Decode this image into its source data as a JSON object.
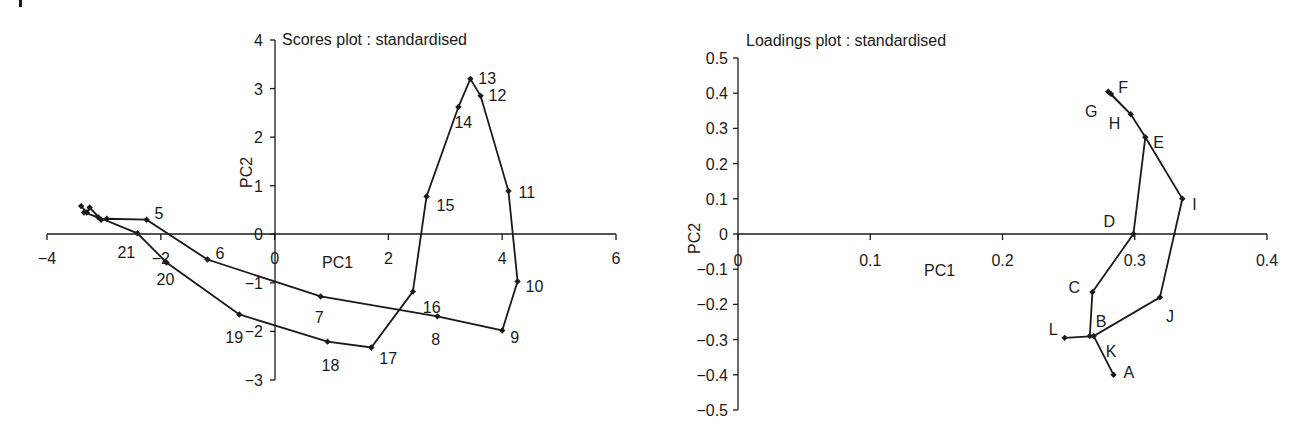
{
  "chart_data": [
    {
      "id": "scores",
      "type": "line",
      "title": "Scores plot : standardised",
      "xlabel": "PC1",
      "ylabel": "PC2",
      "xlim": [
        -4,
        6
      ],
      "ylim": [
        -3,
        4
      ],
      "xticks": [
        -4,
        -2,
        0,
        2,
        4,
        6
      ],
      "xtick_labels": [
        "−4",
        "−2",
        "0",
        "2",
        "4",
        "6"
      ],
      "yticks": [
        -3,
        -2,
        -1,
        0,
        1,
        2,
        3,
        4
      ],
      "ytick_labels": [
        "−3",
        "−2",
        "−1",
        "0",
        "1",
        "2",
        "3",
        "4"
      ],
      "grid": false,
      "legend": null,
      "marker": "diamond",
      "connected": true,
      "points": [
        {
          "label": "1",
          "x": -3.4,
          "y": 0.58,
          "show_label": false
        },
        {
          "label": "2",
          "x": -3.3,
          "y": 0.45,
          "show_label": false
        },
        {
          "label": "3",
          "x": -3.25,
          "y": 0.55,
          "show_label": false
        },
        {
          "label": "4",
          "x": -3.05,
          "y": 0.3,
          "show_label": false
        },
        {
          "label": "",
          "x": -2.95,
          "y": 0.32,
          "show_label": false
        },
        {
          "label": "5",
          "x": -2.25,
          "y": 0.3,
          "show_label": true
        },
        {
          "label": "6",
          "x": -1.18,
          "y": -0.52,
          "show_label": true
        },
        {
          "label": "7",
          "x": 0.81,
          "y": -1.28,
          "show_label": true
        },
        {
          "label": "8",
          "x": 2.86,
          "y": -1.69,
          "show_label": true
        },
        {
          "label": "9",
          "x": 4.0,
          "y": -1.98,
          "show_label": true
        },
        {
          "label": "10",
          "x": 4.27,
          "y": -0.97,
          "show_label": true
        },
        {
          "label": "11",
          "x": 4.11,
          "y": 0.89,
          "show_label": true
        },
        {
          "label": "12",
          "x": 3.62,
          "y": 2.85,
          "show_label": true
        },
        {
          "label": "13",
          "x": 3.44,
          "y": 3.2,
          "show_label": true
        },
        {
          "label": "14",
          "x": 3.23,
          "y": 2.62,
          "show_label": true
        },
        {
          "label": "15",
          "x": 2.67,
          "y": 0.78,
          "show_label": true
        },
        {
          "label": "16",
          "x": 2.43,
          "y": -1.18,
          "show_label": true
        },
        {
          "label": "17",
          "x": 1.7,
          "y": -2.33,
          "show_label": true
        },
        {
          "label": "18",
          "x": 0.93,
          "y": -2.21,
          "show_label": true
        },
        {
          "label": "19",
          "x": -0.62,
          "y": -1.65,
          "show_label": true
        },
        {
          "label": "20",
          "x": -1.9,
          "y": -0.58,
          "show_label": true
        },
        {
          "label": "21",
          "x": -2.41,
          "y": 0.02,
          "show_label": true
        },
        {
          "label": "",
          "x": -3.1,
          "y": 0.35,
          "show_label": false
        },
        {
          "label": "",
          "x": -3.35,
          "y": 0.45,
          "show_label": false
        }
      ],
      "label_offsets": {
        "5": [
          8,
          -6
        ],
        "6": [
          8,
          -6
        ],
        "7": [
          -6,
          22
        ],
        "8": [
          -6,
          24
        ],
        "9": [
          8,
          8
        ],
        "10": [
          8,
          6
        ],
        "11": [
          10,
          2
        ],
        "12": [
          8,
          0
        ],
        "13": [
          8,
          0
        ],
        "14": [
          -4,
          16
        ],
        "15": [
          10,
          10
        ],
        "16": [
          10,
          16
        ],
        "17": [
          8,
          12
        ],
        "18": [
          -6,
          24
        ],
        "19": [
          -14,
          24
        ],
        "20": [
          -10,
          18
        ],
        "21": [
          -20,
          20
        ]
      }
    },
    {
      "id": "loadings",
      "type": "line",
      "title": "Loadings plot : standardised",
      "xlabel": "PC1",
      "ylabel": "PC2",
      "xlim": [
        0,
        0.4
      ],
      "ylim": [
        -0.5,
        0.5
      ],
      "xticks": [
        0,
        0.1,
        0.2,
        0.3,
        0.4
      ],
      "xtick_labels": [
        "0",
        "0.1",
        "0.2",
        "0.3",
        "0.4"
      ],
      "yticks": [
        -0.5,
        -0.4,
        -0.3,
        -0.2,
        -0.1,
        0,
        0.1,
        0.2,
        0.3,
        0.4,
        0.5
      ],
      "ytick_labels": [
        "−0.5",
        "−0.4",
        "−0.3",
        "−0.2",
        "−0.1",
        "0",
        "0.1",
        "0.2",
        "0.3",
        "0.4",
        "0.5"
      ],
      "grid": false,
      "legend": null,
      "marker": "diamond",
      "connected": true,
      "points": [
        {
          "label": "A",
          "x": 0.284,
          "y": -0.4,
          "show_label": true
        },
        {
          "label": "B",
          "x": 0.266,
          "y": -0.29,
          "show_label": true
        },
        {
          "label": "C",
          "x": 0.268,
          "y": -0.165,
          "show_label": true
        },
        {
          "label": "D",
          "x": 0.299,
          "y": 0.0,
          "show_label": true
        },
        {
          "label": "E",
          "x": 0.308,
          "y": 0.275,
          "show_label": true
        },
        {
          "label": "F",
          "x": 0.28,
          "y": 0.404,
          "show_label": true
        },
        {
          "label": "G",
          "x": 0.282,
          "y": 0.398,
          "show_label": true
        },
        {
          "label": "H",
          "x": 0.297,
          "y": 0.34,
          "show_label": true
        },
        {
          "label": "I",
          "x": 0.336,
          "y": 0.1,
          "show_label": true
        },
        {
          "label": "J",
          "x": 0.319,
          "y": -0.18,
          "show_label": true
        },
        {
          "label": "K",
          "x": 0.269,
          "y": -0.29,
          "show_label": true
        },
        {
          "label": "L",
          "x": 0.247,
          "y": -0.295,
          "show_label": true
        }
      ],
      "path_order": [
        "A",
        "K",
        "B",
        "C",
        "D",
        "E",
        "H",
        "G",
        "F",
        "H",
        "E",
        "I",
        "J",
        "K",
        "L"
      ],
      "label_offsets": {
        "A": [
          10,
          -2
        ],
        "B": [
          6,
          -14
        ],
        "C": [
          -24,
          -4
        ],
        "D": [
          -30,
          -12
        ],
        "E": [
          8,
          6
        ],
        "F": [
          10,
          -4
        ],
        "G": [
          -26,
          18
        ],
        "H": [
          -22,
          10
        ],
        "I": [
          10,
          6
        ],
        "J": [
          6,
          20
        ],
        "K": [
          12,
          16
        ],
        "L": [
          -16,
          -8
        ]
      }
    }
  ]
}
